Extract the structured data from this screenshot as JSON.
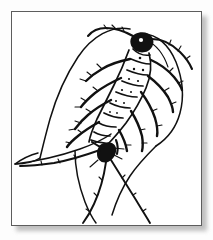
{
  "document": {
    "type": "framed-illustration",
    "title": "Silverfish line drawing",
    "caption": ""
  },
  "frame": {
    "border_color": "#5d5d5d",
    "background_color": "#ffffff",
    "shadow_color": "#9a9a9a",
    "page_background": "#fdfdfd"
  },
  "illustration": {
    "subject": "silverfish",
    "style": "black ink line art",
    "ink_color": "#111111",
    "parts": [
      {
        "name": "body-outline",
        "label": "teardrop body outline"
      },
      {
        "name": "head",
        "label": "head"
      },
      {
        "name": "antenna-left",
        "label": "left antenna"
      },
      {
        "name": "antenna-right",
        "label": "right antenna"
      },
      {
        "name": "thorax-segments",
        "label": "thoracic segments"
      },
      {
        "name": "abdomen-segments",
        "label": "abdominal segments"
      },
      {
        "name": "legs-left",
        "label": "left legs"
      },
      {
        "name": "legs-right",
        "label": "right legs"
      },
      {
        "name": "cercus-left",
        "label": "left cercus"
      },
      {
        "name": "cercus-center",
        "label": "median caudal filament"
      },
      {
        "name": "cercus-right",
        "label": "right cercus"
      }
    ]
  }
}
